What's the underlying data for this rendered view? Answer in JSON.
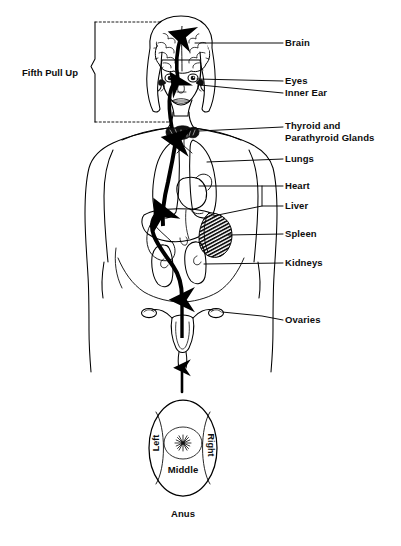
{
  "figure": {
    "ink_color": "#000000",
    "background_color": "#ffffff"
  },
  "bracket": {
    "label": "Fifth Pull Up",
    "style": "solid vertical line with center pointer and dotted horizontal extensions"
  },
  "labels": [
    {
      "id": "brain",
      "text": "Brain"
    },
    {
      "id": "eyes",
      "text": "Eyes"
    },
    {
      "id": "inner-ear",
      "text": "Inner Ear"
    },
    {
      "id": "thyroid-line1",
      "text": "Thyroid and"
    },
    {
      "id": "thyroid-line2",
      "text": "Parathyroid Glands"
    },
    {
      "id": "lungs",
      "text": "Lungs"
    },
    {
      "id": "heart",
      "text": "Heart"
    },
    {
      "id": "liver",
      "text": "Liver"
    },
    {
      "id": "spleen",
      "text": "Spleen"
    },
    {
      "id": "kidneys",
      "text": "Kidneys"
    },
    {
      "id": "ovaries",
      "text": "Ovaries"
    }
  ],
  "anus_diagram": {
    "left": "Left",
    "right": "Right",
    "middle": "Middle",
    "caption": "Anus"
  },
  "ghost_text": "",
  "organs": [
    "brain",
    "eyes",
    "inner ear",
    "thyroid and parathyroid glands",
    "lungs",
    "heart",
    "liver",
    "spleen",
    "kidneys",
    "ovaries",
    "uterus",
    "anus"
  ]
}
